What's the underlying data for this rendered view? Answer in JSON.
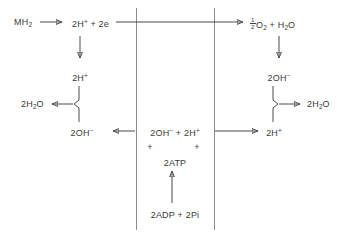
{
  "diagram": {
    "type": "biochemical-flow-diagram",
    "colors": {
      "background": "#ffffff",
      "text": "#3a3a3a",
      "line": "#4a4a4a",
      "membrane": "#8d8d8d"
    },
    "membrane": {
      "left_rule_x": 136,
      "right_rule_x": 214,
      "top_y": 8,
      "bottom_y": 230
    },
    "labels": {
      "substrate": "MH",
      "substrate_sub": "2",
      "proton_electron_pre": "2H",
      "proton_electron_sup": "+",
      "proton_electron_post": " + 2e",
      "oxygen_half_num": "1",
      "oxygen_half_den": "2",
      "oxygen_rest_a": "O",
      "oxygen_rest_a_sub": "2",
      "oxygen_plus": " + H",
      "oxygen_rest_b_sub": "2",
      "oxygen_rest_b": "O",
      "left_protons": "2H",
      "left_protons_sup": "+",
      "left_water": "2H",
      "left_water_sub": "2",
      "left_water_post": "O",
      "left_hydroxide": "2OH",
      "left_hydroxide_sup": "−",
      "right_hydroxide": "2OH",
      "right_hydroxide_sup": "−",
      "right_protons": "2H",
      "right_protons_sup": "+",
      "right_water": "2H",
      "right_water_sub": "2",
      "right_water_post": "O",
      "center_hydroxide": "2OH",
      "center_hydroxide_sup": "−",
      "center_join": " + ",
      "center_protons": "2H",
      "center_protons_sup": "+",
      "center_plus_left": "+",
      "center_plus_right": "+",
      "center_atp": "2ATP",
      "center_adp": "2ADP + 2Pi"
    }
  }
}
